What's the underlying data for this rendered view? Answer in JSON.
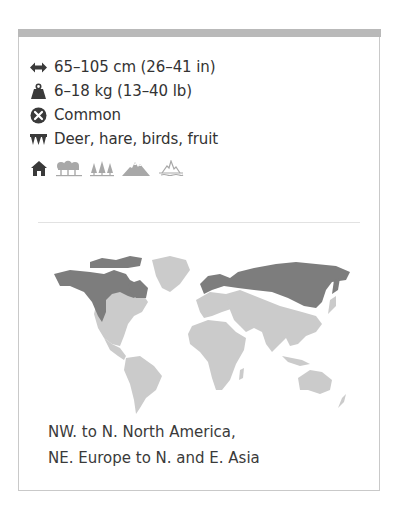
{
  "facts": {
    "length": {
      "icon": "length-arrows-icon",
      "text": "65–105 cm (26–41 in)"
    },
    "weight": {
      "icon": "weight-icon",
      "text": "6–18 kg (13–40 lb)"
    },
    "status": {
      "icon": "status-x-circle-icon",
      "text": "Common"
    },
    "diet": {
      "icon": "teeth-icon",
      "text": "Deer, hare, birds, fruit"
    }
  },
  "habitats": [
    {
      "name": "urban",
      "icon": "house-icon",
      "active": true
    },
    {
      "name": "deciduous-forest",
      "icon": "deciduous-trees-icon",
      "active": false
    },
    {
      "name": "coniferous-forest",
      "icon": "conifer-trees-icon",
      "active": false
    },
    {
      "name": "mountains",
      "icon": "mountains-icon",
      "active": false
    },
    {
      "name": "tundra",
      "icon": "tundra-icon",
      "active": false
    }
  ],
  "map": {
    "colors": {
      "range": "#7d7d7d",
      "land": "#cbcbcb"
    },
    "range_description_line1": "NW. to N. North America,",
    "range_description_line2": "NE. Europe to N. and E. Asia"
  },
  "colors": {
    "topbar": "#b9b9b9",
    "border": "#c9c9c9",
    "text": "#333333",
    "icon_active": "#3a3a3a",
    "icon_inactive": "#a8a8a8"
  }
}
